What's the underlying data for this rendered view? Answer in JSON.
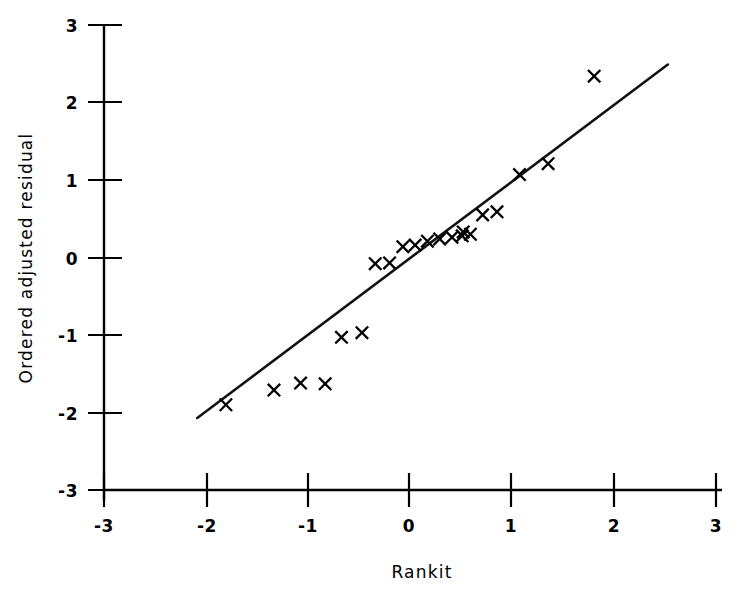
{
  "chart_data": {
    "type": "scatter",
    "title": "",
    "xlabel": "Rankit",
    "ylabel": "Ordered adjusted residual",
    "xlim": [
      -3,
      3
    ],
    "ylim": [
      -3,
      3
    ],
    "xticks": [
      -3,
      -2,
      -1,
      0,
      1,
      2,
      3
    ],
    "yticks": [
      -3,
      -2,
      -1,
      0,
      1,
      2,
      3
    ],
    "xticklabels": [
      "-3",
      "-2",
      "-1",
      "0",
      "1",
      "2",
      "3"
    ],
    "yticklabels": [
      "-3",
      "-2",
      "-1",
      "0",
      "1",
      "2",
      "3"
    ],
    "grid": false,
    "legend": null,
    "marker": "x",
    "marker_color": "#000000",
    "line_color": "#111111",
    "x": [
      -1.79,
      -1.32,
      -1.06,
      -0.82,
      -0.66,
      -0.46,
      -0.33,
      -0.19,
      -0.06,
      0.06,
      0.18,
      0.3,
      0.42,
      0.52,
      0.53,
      0.86,
      1.08,
      1.36,
      1.81
    ],
    "y": [
      -1.9,
      -1.71,
      -1.62,
      -1.63,
      -1.03,
      -0.97,
      -0.08,
      -0.07,
      0.14,
      0.16,
      0.21,
      0.24,
      0.26,
      0.28,
      0.33,
      0.59,
      1.07,
      1.21,
      1.57
    ],
    "points": [
      {
        "x": -1.79,
        "y": -1.9
      },
      {
        "x": -1.32,
        "y": -1.71
      },
      {
        "x": -1.06,
        "y": -1.62
      },
      {
        "x": -0.82,
        "y": -1.63
      },
      {
        "x": -0.66,
        "y": -1.03
      },
      {
        "x": -0.46,
        "y": -0.97
      },
      {
        "x": -0.33,
        "y": -0.08
      },
      {
        "x": -0.19,
        "y": -0.07
      },
      {
        "x": -0.06,
        "y": 0.14
      },
      {
        "x": 0.06,
        "y": 0.16
      },
      {
        "x": 0.18,
        "y": 0.21
      },
      {
        "x": 0.3,
        "y": 0.24
      },
      {
        "x": 0.42,
        "y": 0.26
      },
      {
        "x": 0.52,
        "y": 0.28
      },
      {
        "x": 0.53,
        "y": 0.33
      },
      {
        "x": 0.86,
        "y": 0.59
      },
      {
        "x": 1.08,
        "y": 1.07
      },
      {
        "x": 1.36,
        "y": 1.21
      },
      {
        "x": 1.81,
        "y": 2.34
      },
      {
        "x": 0.6,
        "y": 0.3
      },
      {
        "x": 0.72,
        "y": 0.55
      }
    ],
    "reference_line": {
      "x0": -2.07,
      "y0": -2.07,
      "x1": 2.53,
      "y1": 2.49,
      "description": "fitted straight line"
    }
  }
}
